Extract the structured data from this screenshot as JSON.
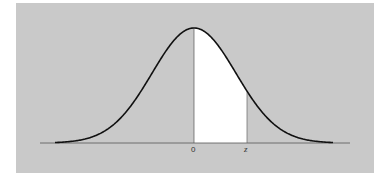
{
  "diagram": {
    "type": "standard-normal-curve",
    "labels": {
      "mean": "0",
      "z": "z"
    },
    "shaded_region": {
      "from": "0",
      "to": "z",
      "fill": "#ffffff"
    },
    "colors": {
      "background": "#c9c9c9",
      "curve": "#111111",
      "axis": "#555555"
    }
  },
  "chart_data": {
    "type": "area",
    "title": "",
    "xlabel": "",
    "ylabel": "",
    "x_tick_labels": [
      "0",
      "z"
    ],
    "series": [
      {
        "name": "standard normal density",
        "description": "bell curve, area between 0 and z shaded white"
      }
    ],
    "grid": false
  }
}
